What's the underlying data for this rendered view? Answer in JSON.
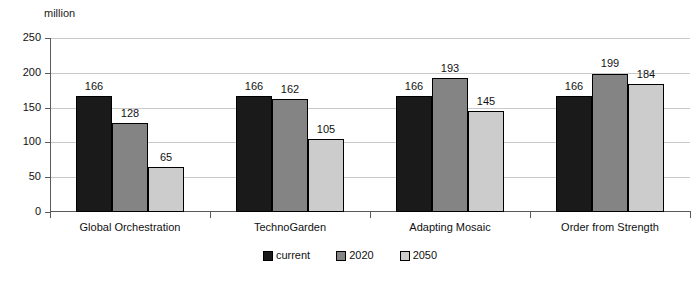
{
  "chart_data": {
    "type": "bar",
    "title": "",
    "subtitle": "",
    "unit_label": "million",
    "xlabel": "",
    "ylabel": "",
    "ylim": [
      0,
      250
    ],
    "yticks": [
      0,
      50,
      100,
      150,
      200,
      250
    ],
    "ytick_labels": [
      "0",
      "50",
      "100",
      "150",
      "200",
      "250"
    ],
    "grid": true,
    "grid_axis": "y",
    "legend_position": "bottom-center",
    "categories": [
      "Global Orchestration",
      "TechnoGarden",
      "Adapting Mosaic",
      "Order from Strength"
    ],
    "series": [
      {
        "name": "current",
        "color": "#1a1a1a",
        "values": [
          166,
          166,
          166,
          166
        ]
      },
      {
        "name": "2020",
        "color": "#848484",
        "values": [
          128,
          162,
          193,
          199
        ]
      },
      {
        "name": "2050",
        "color": "#cccccc",
        "values": [
          65,
          105,
          145,
          184
        ]
      }
    ],
    "data_labels": [
      [
        "166",
        "128",
        "65"
      ],
      [
        "166",
        "162",
        "105"
      ],
      [
        "166",
        "193",
        "145"
      ],
      [
        "166",
        "199",
        "184"
      ]
    ]
  },
  "legend": {
    "items": [
      {
        "label": "current",
        "color": "#1a1a1a"
      },
      {
        "label": "2020",
        "color": "#848484"
      },
      {
        "label": "2050",
        "color": "#cccccc"
      }
    ]
  },
  "colors": {
    "background": "#ffffff",
    "axis": "#5a5a5a",
    "gridline": "#c9c9c9",
    "text": "#111111",
    "series_current": "#1a1a1a",
    "series_2020": "#848484",
    "series_2050": "#cccccc"
  }
}
